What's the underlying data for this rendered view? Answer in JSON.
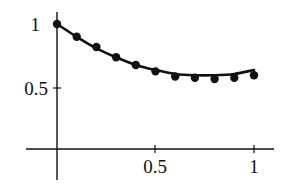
{
  "chart_data": {
    "type": "line",
    "title": "",
    "xlabel": "",
    "ylabel": "",
    "xlim": [
      -0.13,
      1.25
    ],
    "ylim": [
      0,
      1.08
    ],
    "grid": false,
    "legend": null,
    "x_ticks": [
      0.5,
      1
    ],
    "x_tick_labels": [
      "0.5",
      "1"
    ],
    "y_ticks": [
      0.5,
      1
    ],
    "y_tick_labels": [
      "0.5",
      "1"
    ],
    "series": [
      {
        "name": "fitted-curve",
        "style": "solid-line",
        "x": [
          0,
          0.1,
          0.2,
          0.3,
          0.4,
          0.5,
          0.6,
          0.7,
          0.8,
          0.9,
          1.0
        ],
        "values": [
          1.0,
          0.9,
          0.81,
          0.74,
          0.68,
          0.64,
          0.61,
          0.6,
          0.6,
          0.61,
          0.64
        ]
      },
      {
        "name": "data-points",
        "style": "dots",
        "x": [
          0,
          0.1,
          0.2,
          0.3,
          0.4,
          0.5,
          0.6,
          0.7,
          0.8,
          0.9,
          1.0
        ],
        "values": [
          1.0,
          0.9,
          0.82,
          0.74,
          0.68,
          0.63,
          0.59,
          0.58,
          0.57,
          0.58,
          0.6
        ]
      }
    ]
  },
  "labels": {
    "y_tick_1": "1",
    "y_tick_05": "0.5",
    "x_tick_05": "0.5",
    "x_tick_1": "1"
  }
}
